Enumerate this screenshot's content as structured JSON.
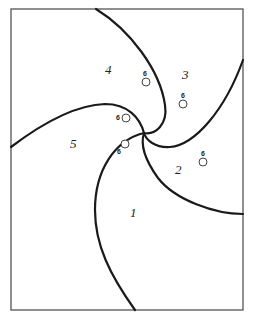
{
  "diagram": {
    "type": "spiral-partition",
    "frame": {
      "x": 11,
      "y": 9,
      "width": 232,
      "height": 301,
      "stroke": "#555555"
    },
    "center": {
      "x": 144,
      "y": 133
    },
    "regions": [
      {
        "id": "1",
        "label": "1",
        "x": 133,
        "y": 217
      },
      {
        "id": "2",
        "label": "2",
        "x": 179,
        "y": 174
      },
      {
        "id": "3",
        "label": "3",
        "x": 186,
        "y": 79
      },
      {
        "id": "4",
        "label": "4",
        "x": 109,
        "y": 74
      },
      {
        "id": "5",
        "label": "5",
        "x": 74,
        "y": 148
      }
    ],
    "markers": [
      {
        "label": "6",
        "cx": 146,
        "cy": 82,
        "lx": 143,
        "ly": 75
      },
      {
        "label": "6",
        "cx": 183,
        "cy": 104,
        "lx": 181,
        "ly": 97
      },
      {
        "label": "6",
        "cx": 126,
        "cy": 118,
        "lx": 117,
        "ly": 118
      },
      {
        "label": "6",
        "cx": 125,
        "cy": 144,
        "lx": 118,
        "ly": 153
      },
      {
        "label": "6",
        "cx": 203,
        "cy": 162,
        "lx": 201,
        "ly": 155
      }
    ],
    "colors": {
      "stroke": "#1a1a1a",
      "background": "#ffffff"
    }
  }
}
